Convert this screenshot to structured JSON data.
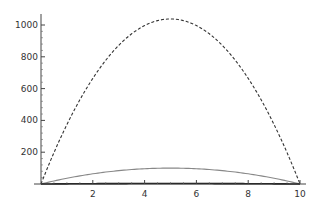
{
  "chart_data": {
    "type": "line",
    "title": "",
    "xlabel": "",
    "ylabel": "",
    "xlim": [
      0,
      10
    ],
    "ylim": [
      0,
      1050
    ],
    "grid": false,
    "legend": null,
    "x_ticks": [
      "2",
      "4",
      "6",
      "8",
      "10"
    ],
    "y_ticks": [
      "200",
      "400",
      "600",
      "800",
      "1000"
    ],
    "x": [
      0,
      1,
      2,
      3,
      4,
      5,
      6,
      7,
      8,
      9,
      10
    ],
    "series": [
      {
        "name": "dashed",
        "style": "dashed",
        "color": "#333333",
        "values": [
          0,
          374,
          664,
          872,
          996,
          1038,
          996,
          872,
          664,
          374,
          0
        ]
      },
      {
        "name": "gray",
        "style": "solid",
        "color": "#888888",
        "values": [
          0,
          36,
          64,
          84,
          96,
          100,
          96,
          84,
          64,
          36,
          0
        ]
      },
      {
        "name": "black",
        "style": "solid",
        "color": "#111111",
        "values": [
          0,
          1,
          2,
          2,
          2,
          3,
          2,
          2,
          2,
          1,
          0
        ]
      }
    ]
  }
}
